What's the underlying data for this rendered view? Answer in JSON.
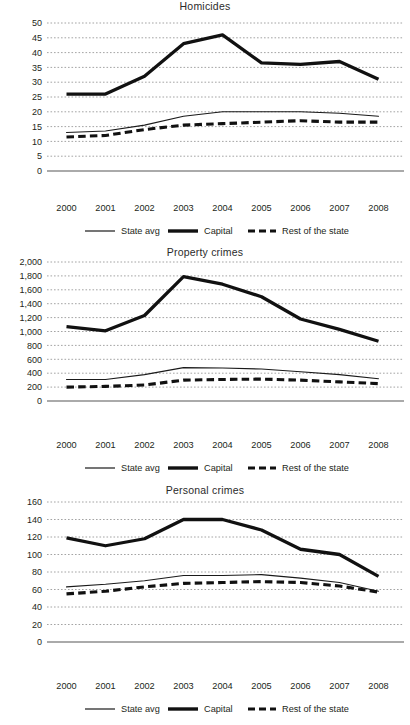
{
  "figure": {
    "background": "#ffffff",
    "text_color": "#231f20",
    "grid_color": "#9a9a9a",
    "line_color": "#111111"
  },
  "legend": {
    "items": [
      {
        "label": "State avg",
        "style": "thin-solid"
      },
      {
        "label": "Capital",
        "style": "thick-solid"
      },
      {
        "label": "Rest of the state",
        "style": "thick-dashed"
      }
    ]
  },
  "panels": [
    {
      "id": "homicides",
      "title": "Homicides"
    },
    {
      "id": "property",
      "title": "Property crimes"
    },
    {
      "id": "personal",
      "title": "Personal crimes"
    }
  ],
  "chart_data": [
    {
      "type": "line",
      "title": "Homicides",
      "xlabel": "",
      "ylabel": "",
      "x": [
        "2000",
        "2001",
        "2002",
        "2003",
        "2004",
        "2005",
        "2006",
        "2007",
        "2008"
      ],
      "categories": [
        "2000",
        "2001",
        "2002",
        "2003",
        "2004",
        "2005",
        "2006",
        "2007",
        "2008"
      ],
      "ylim": [
        0,
        50
      ],
      "yticks": [
        0,
        5,
        10,
        15,
        20,
        25,
        30,
        35,
        40,
        45,
        50
      ],
      "ytick_labels": [
        "0",
        "5",
        "10",
        "15",
        "20",
        "25",
        "30",
        "35",
        "40",
        "45",
        "50"
      ],
      "grid": true,
      "legend_position": "bottom",
      "series": [
        {
          "name": "State avg",
          "style": "thin-solid",
          "values": [
            13,
            13.5,
            15.5,
            18.5,
            20,
            20,
            20,
            19.5,
            18.5
          ]
        },
        {
          "name": "Capital",
          "style": "thick-solid",
          "values": [
            26,
            26,
            32,
            43,
            46,
            36.5,
            36,
            37,
            31
          ]
        },
        {
          "name": "Rest of the state",
          "style": "thick-dashed",
          "values": [
            11.5,
            12,
            14,
            15.5,
            16,
            16.5,
            17,
            16.5,
            16.5
          ]
        }
      ]
    },
    {
      "type": "line",
      "title": "Property crimes",
      "xlabel": "",
      "ylabel": "",
      "x": [
        "2000",
        "2001",
        "2002",
        "2003",
        "2004",
        "2005",
        "2006",
        "2007",
        "2008"
      ],
      "categories": [
        "2000",
        "2001",
        "2002",
        "2003",
        "2004",
        "2005",
        "2006",
        "2007",
        "2008"
      ],
      "ylim": [
        0,
        2000
      ],
      "yticks": [
        0,
        200,
        400,
        600,
        800,
        1000,
        1200,
        1400,
        1600,
        1800,
        2000
      ],
      "ytick_labels": [
        "0",
        "200",
        "400",
        "600",
        "800",
        "1,000",
        "1,200",
        "1,400",
        "1,600",
        "1,800",
        "2,000"
      ],
      "grid": true,
      "legend_position": "bottom",
      "series": [
        {
          "name": "State avg",
          "style": "thin-solid",
          "values": [
            310,
            310,
            380,
            480,
            475,
            460,
            420,
            380,
            320
          ]
        },
        {
          "name": "Capital",
          "style": "thick-solid",
          "values": [
            1070,
            1010,
            1230,
            1790,
            1680,
            1500,
            1180,
            1030,
            860
          ]
        },
        {
          "name": "Rest of the state",
          "style": "thick-dashed",
          "values": [
            200,
            210,
            230,
            300,
            310,
            315,
            300,
            275,
            250
          ]
        }
      ]
    },
    {
      "type": "line",
      "title": "Personal crimes",
      "xlabel": "",
      "ylabel": "",
      "x": [
        "2000",
        "2001",
        "2002",
        "2003",
        "2004",
        "2005",
        "2006",
        "2007",
        "2008"
      ],
      "categories": [
        "2000",
        "2001",
        "2002",
        "2003",
        "2004",
        "2005",
        "2006",
        "2007",
        "2008"
      ],
      "ylim": [
        0,
        160
      ],
      "yticks": [
        0,
        20,
        40,
        60,
        80,
        100,
        120,
        140,
        160
      ],
      "ytick_labels": [
        "0",
        "20",
        "40",
        "60",
        "80",
        "100",
        "120",
        "140",
        "160"
      ],
      "grid": true,
      "legend_position": "bottom",
      "series": [
        {
          "name": "State avg",
          "style": "thin-solid",
          "values": [
            63,
            66,
            70,
            76,
            76,
            77,
            73,
            68,
            58
          ]
        },
        {
          "name": "Capital",
          "style": "thick-solid",
          "values": [
            119,
            110,
            118,
            140,
            140,
            128,
            106,
            100,
            75
          ]
        },
        {
          "name": "Rest of the state",
          "style": "thick-dashed",
          "values": [
            55,
            58,
            63,
            67,
            68,
            69,
            68,
            64,
            57
          ]
        }
      ]
    }
  ]
}
